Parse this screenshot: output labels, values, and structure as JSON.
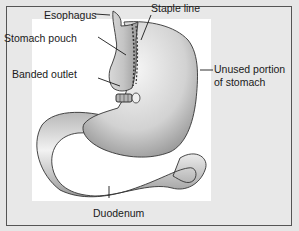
{
  "diagram": {
    "labels": {
      "staple_line": "Staple line",
      "esophagus": "Esophagus",
      "stomach_pouch": "Stomach pouch",
      "banded_outlet": "Banded outlet",
      "unused_portion_line1": "Unused portion",
      "unused_portion_line2": "of stomach",
      "duodenum": "Duodenum"
    },
    "colors": {
      "background": "#e6e6e6",
      "panel": "#ffffff",
      "border": "#555555",
      "organ_light": "#f4f4f4",
      "organ_mid": "#c8c8c8",
      "organ_dark": "#8a8a8a",
      "outline": "#333333"
    }
  }
}
